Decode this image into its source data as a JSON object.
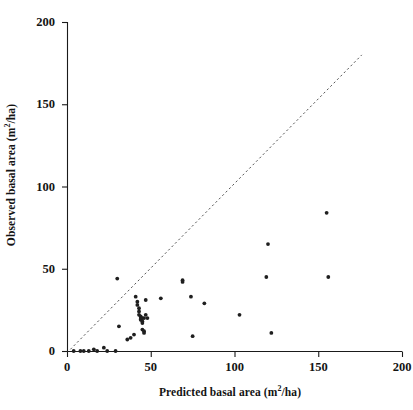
{
  "figure": {
    "background_color": "#ffffff",
    "ink_color": "#1a1a1a"
  },
  "chart_data": {
    "type": "scatter",
    "title": "",
    "xlabel": "Predicted basal area (m2/ha)",
    "ylabel": "Observed basal area (m2/ha)",
    "xlabel_parts": {
      "pre": "Predicted basal area (m",
      "sup": "2",
      "post": "/ha)"
    },
    "ylabel_parts": {
      "pre": "Observed basal area (m",
      "sup": "2",
      "post": "/ha)"
    },
    "xlim": [
      0,
      200
    ],
    "ylim": [
      0,
      200
    ],
    "xticks": [
      0,
      50,
      100,
      150,
      200
    ],
    "yticks": [
      0,
      50,
      100,
      150,
      200
    ],
    "xtick_labels": [
      "0",
      "50",
      "100",
      "150",
      "200"
    ],
    "ytick_labels": [
      "0",
      "50",
      "100",
      "150",
      "200"
    ],
    "grid": false,
    "legend": false,
    "marker": {
      "shape": "circle",
      "size_px": 3,
      "color": "#1f1f1f"
    },
    "reference_line": {
      "name": "1:1 line",
      "style": "dashed",
      "color": "#555555",
      "x_start": 2,
      "y_start": 1,
      "x_end": 176,
      "y_end": 180
    },
    "series": [
      {
        "name": "Plots",
        "points": [
          [
            4,
            0
          ],
          [
            8,
            0
          ],
          [
            10,
            0
          ],
          [
            13,
            0
          ],
          [
            16,
            1
          ],
          [
            18,
            0
          ],
          [
            22,
            2
          ],
          [
            24,
            0
          ],
          [
            29,
            0
          ],
          [
            30,
            44
          ],
          [
            31,
            15
          ],
          [
            36,
            7
          ],
          [
            38,
            8
          ],
          [
            40,
            10
          ],
          [
            41,
            33
          ],
          [
            42,
            30
          ],
          [
            42,
            28
          ],
          [
            43,
            26
          ],
          [
            43,
            24
          ],
          [
            43,
            22
          ],
          [
            44,
            21
          ],
          [
            44,
            20
          ],
          [
            44,
            19
          ],
          [
            45,
            20
          ],
          [
            45,
            18
          ],
          [
            45,
            17
          ],
          [
            45,
            13
          ],
          [
            46,
            12
          ],
          [
            46,
            11
          ],
          [
            46,
            20
          ],
          [
            47,
            22
          ],
          [
            47,
            31
          ],
          [
            48,
            20
          ],
          [
            56,
            32
          ],
          [
            69,
            42
          ],
          [
            69,
            43
          ],
          [
            74,
            33
          ],
          [
            75,
            9
          ],
          [
            82,
            29
          ],
          [
            103,
            22
          ],
          [
            119,
            45
          ],
          [
            122,
            11
          ],
          [
            120,
            65
          ],
          [
            155,
            84
          ],
          [
            156,
            45
          ]
        ]
      }
    ]
  },
  "axes_geometry": {
    "x0_px": 67,
    "x200_px": 402,
    "y0_px": 351,
    "y200_px": 22
  }
}
